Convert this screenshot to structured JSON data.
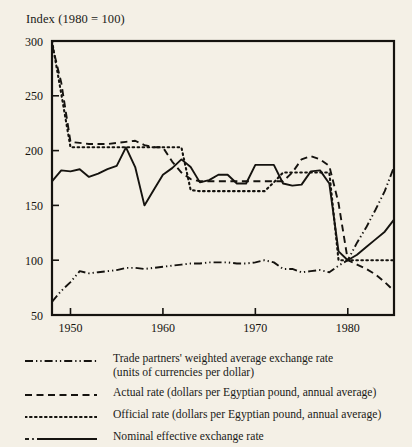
{
  "chart_data": {
    "type": "line",
    "title": "Index (1980 = 100)",
    "xlabel": "",
    "ylabel": "",
    "xlim": [
      1948,
      1985
    ],
    "ylim": [
      50,
      300
    ],
    "yticks": [
      50,
      100,
      150,
      200,
      250,
      300
    ],
    "xticks": [
      1950,
      1960,
      1970,
      1980
    ],
    "grid": false,
    "legend_position": "below",
    "x": [
      1948,
      1949,
      1950,
      1951,
      1952,
      1953,
      1954,
      1955,
      1956,
      1957,
      1958,
      1959,
      1960,
      1961,
      1962,
      1963,
      1964,
      1965,
      1966,
      1967,
      1968,
      1969,
      1970,
      1971,
      1972,
      1973,
      1974,
      1975,
      1976,
      1977,
      1978,
      1979,
      1980,
      1981,
      1982,
      1983,
      1984,
      1985
    ],
    "series": [
      {
        "name": "Trade partners' weighted average exchange rate (units of currencies per dollar)",
        "style": "dash-dot-dot",
        "values": [
          62,
          72,
          80,
          90,
          88,
          89,
          90,
          91,
          93,
          93,
          92,
          93,
          94,
          95,
          96,
          97,
          97,
          98,
          98,
          98,
          97,
          97,
          98,
          100,
          98,
          92,
          92,
          89,
          90,
          91,
          89,
          95,
          100,
          116,
          130,
          146,
          163,
          185
        ]
      },
      {
        "name": "Actual rate (dollars per Egyptian pound, annual average)",
        "style": "dashed",
        "values": [
          297,
          262,
          208,
          207,
          206,
          206,
          206,
          207,
          208,
          209,
          205,
          203,
          203,
          190,
          180,
          174,
          172,
          172,
          172,
          172,
          172,
          172,
          172,
          172,
          172,
          172,
          180,
          192,
          195,
          192,
          186,
          152,
          100,
          96,
          92,
          87,
          80,
          72
        ]
      },
      {
        "name": "Official rate (dollars per Egyptian pound, annual average)",
        "style": "dotted",
        "values": [
          300,
          252,
          203,
          203,
          203,
          203,
          203,
          203,
          203,
          203,
          203,
          203,
          203,
          203,
          203,
          164,
          163,
          163,
          163,
          163,
          163,
          163,
          163,
          163,
          171,
          180,
          180,
          180,
          180,
          180,
          180,
          100,
          100,
          100,
          100,
          100,
          100,
          100
        ]
      },
      {
        "name": "Nominal effective exchange rate",
        "style": "solid",
        "values": [
          172,
          182,
          181,
          183,
          176,
          179,
          183,
          186,
          203,
          185,
          150,
          164,
          178,
          184,
          192,
          185,
          171,
          173,
          178,
          178,
          170,
          170,
          187,
          187,
          187,
          170,
          168,
          169,
          181,
          182,
          170,
          108,
          100,
          105,
          112,
          119,
          126,
          137
        ]
      }
    ]
  },
  "legend": {
    "items": [
      {
        "sample": "dash-dot-dot-line-sample",
        "label": "Trade partners' weighted average exchange rate\n(units of currencies per dollar)"
      },
      {
        "sample": "dashed-line-sample",
        "label": "Actual rate (dollars per Egyptian pound, annual average)"
      },
      {
        "sample": "dotted-line-sample",
        "label": "Official rate (dollars per Egyptian pound, annual average)"
      },
      {
        "sample": "solid-line-sample",
        "label": "Nominal effective exchange rate"
      }
    ]
  },
  "colors": {
    "background": "#f4f0e6",
    "ink": "#15130f"
  }
}
